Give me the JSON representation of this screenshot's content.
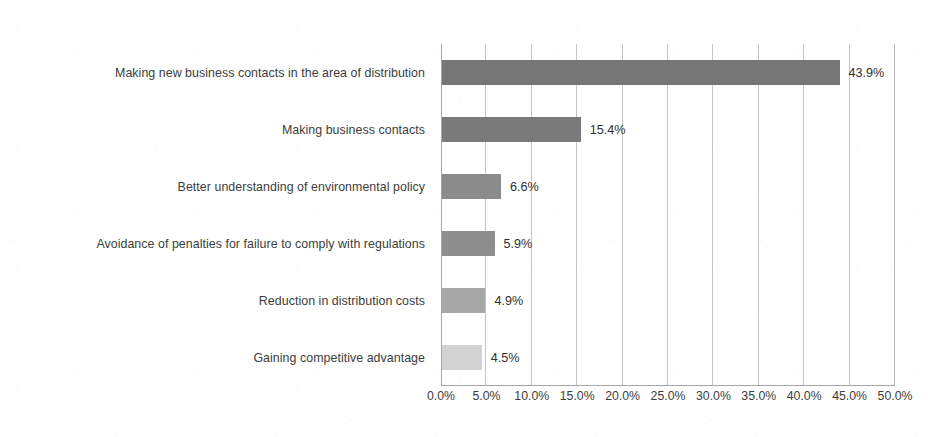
{
  "chart_data": {
    "type": "bar",
    "orientation": "horizontal",
    "title": "",
    "xlabel": "",
    "ylabel": "",
    "xlim": [
      0,
      50
    ],
    "grid": true,
    "legend": false,
    "value_suffix": "%",
    "categories": [
      "Making new business contacts in the area of distribution",
      "Making business contacts",
      "Better understanding of environmental policy",
      "Avoidance of penalties for failure to comply with regulations",
      "Reduction in distribution costs",
      "Gaining competitive advantage"
    ],
    "values": [
      43.9,
      15.4,
      6.6,
      5.9,
      4.9,
      4.5
    ],
    "data_labels": [
      "43.9%",
      "15.4%",
      "6.6%",
      "5.9%",
      "4.9%",
      "4.5%"
    ],
    "bar_colors": [
      "#767676",
      "#7a7a7a",
      "#8b8b8b",
      "#8e8e8e",
      "#a8a8a8",
      "#d2d2d2"
    ],
    "xticks": [
      0,
      5,
      10,
      15,
      20,
      25,
      30,
      35,
      40,
      45,
      50
    ],
    "xtick_labels": [
      "0.0%",
      "5.0%",
      "10.0%",
      "15.0%",
      "20.0%",
      "25.0%",
      "30.0%",
      "35.0%",
      "40.0%",
      "45.0%",
      "50.0%"
    ]
  },
  "style": {
    "background": "#ffffff",
    "axis_color": "#a6a6a6",
    "gridline_color": "#c4c4c4",
    "text_color": "#3d3d3d"
  }
}
